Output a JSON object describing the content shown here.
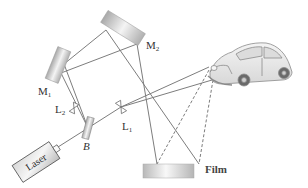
{
  "diagram": {
    "labels": {
      "m1": {
        "main": "M",
        "sub": "1"
      },
      "m2": {
        "main": "M",
        "sub": "2"
      },
      "l1": {
        "main": "L",
        "sub": "1"
      },
      "l2": {
        "main": "L",
        "sub": "2"
      },
      "beam_splitter": "B",
      "laser": "Laser",
      "film": "Film"
    },
    "components": [
      "Laser",
      "Beam splitter B",
      "Lens L1",
      "Lens L2",
      "Mirror M1",
      "Mirror M2",
      "Car (object)",
      "Film"
    ],
    "colors": {
      "beam": "#7a7a7a",
      "mirror_light": "#f2f2f2",
      "mirror_dark": "#a8a8a8",
      "film": "#c8c8c8"
    }
  }
}
